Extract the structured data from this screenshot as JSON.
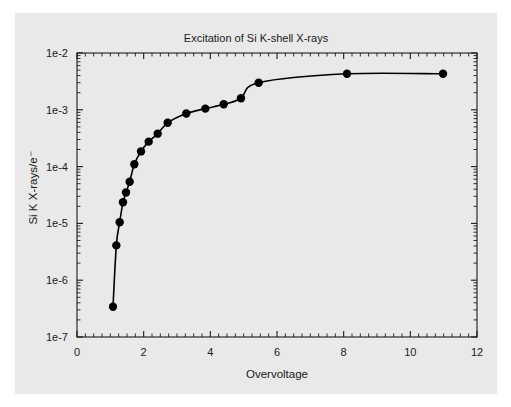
{
  "figure": {
    "background_color": "#ffffff",
    "panel_color": "#e9e9e9",
    "line_color": "#000000",
    "axis_color": "#1a1a1a"
  },
  "chart_data": {
    "type": "line",
    "title": "Excitation of Si K-shell X-rays",
    "xlabel": "Overvoltage",
    "ylabel": "Si K X-rays/e⁻",
    "xscale": "linear",
    "yscale": "log",
    "xlim": [
      0,
      12
    ],
    "ylim": [
      1e-07,
      0.01
    ],
    "grid": false,
    "legend": null,
    "marker": "filled-circle",
    "xticks": [
      0,
      2,
      4,
      6,
      8,
      10,
      12
    ],
    "xtick_labels": [
      "0",
      "2",
      "4",
      "6",
      "8",
      "10",
      "12"
    ],
    "x_minor_tick_interval": 0.25,
    "yticks": [
      0.01,
      0.001,
      0.0001,
      1e-05,
      1e-06,
      1e-07
    ],
    "ytick_labels": [
      "1e-2",
      "1e-3",
      "1e-4",
      "1e-5",
      "1e-6",
      "1e-7"
    ],
    "x": [
      1.08,
      1.18,
      1.28,
      1.38,
      1.47,
      1.58,
      1.72,
      1.9,
      2.15,
      2.42,
      2.7,
      3.27,
      3.82,
      4.38,
      4.9,
      5.45,
      8.1,
      10.98
    ],
    "y": [
      3.4e-07,
      4.1e-06,
      1.05e-05,
      2.35e-05,
      3.5e-05,
      5.4e-05,
      0.00011,
      0.000185,
      0.000275,
      0.00038,
      0.00059,
      0.00086,
      0.00105,
      0.00125,
      0.0016,
      0.003,
      0.0043,
      0.0043
    ],
    "series": [
      {
        "name": "Si K X-ray yield",
        "points": [
          {
            "x": 1.08,
            "y": 3.4e-07
          },
          {
            "x": 1.18,
            "y": 4.1e-06
          },
          {
            "x": 1.28,
            "y": 1.05e-05
          },
          {
            "x": 1.38,
            "y": 2.35e-05
          },
          {
            "x": 1.47,
            "y": 3.5e-05
          },
          {
            "x": 1.58,
            "y": 5.4e-05
          },
          {
            "x": 1.72,
            "y": 0.00011
          },
          {
            "x": 1.92,
            "y": 0.000185
          },
          {
            "x": 2.15,
            "y": 0.000275
          },
          {
            "x": 2.42,
            "y": 0.00038
          },
          {
            "x": 2.72,
            "y": 0.00059
          },
          {
            "x": 3.28,
            "y": 0.00086
          },
          {
            "x": 3.85,
            "y": 0.00105
          },
          {
            "x": 4.4,
            "y": 0.00125
          },
          {
            "x": 4.92,
            "y": 0.0016
          },
          {
            "x": 5.45,
            "y": 0.003
          },
          {
            "x": 8.1,
            "y": 0.0043
          },
          {
            "x": 10.98,
            "y": 0.0043
          }
        ]
      }
    ]
  }
}
